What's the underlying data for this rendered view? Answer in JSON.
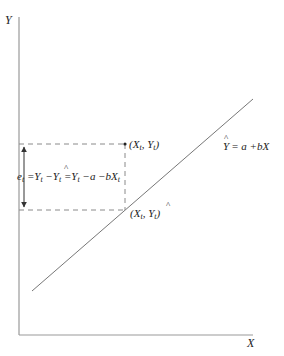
{
  "diagram": {
    "axes": {
      "y_label": "Y",
      "x_label": "X",
      "origin": [
        19,
        335
      ],
      "y_top": 17,
      "x_right": 253
    },
    "regression_line": {
      "equation_label": {
        "y": "Y",
        "rest": "= a +bX"
      },
      "start": [
        32,
        291
      ],
      "end": [
        253,
        99
      ]
    },
    "observed_point": {
      "label_open": "(X",
      "label_sub1": "t",
      "label_mid": ", Y",
      "label_sub2": "t",
      "label_close": ")",
      "position": [
        125,
        144
      ]
    },
    "fitted_point": {
      "label_open": "(X",
      "label_sub1": "t",
      "label_mid": ", Y",
      "label_sub2": "t",
      "label_close": ")",
      "position": [
        125,
        210
      ]
    },
    "residual": {
      "e": "e",
      "e_sub": "t",
      "eq1": " =Y",
      "eq1_sub": "t",
      "minus": " −Y",
      "minus_sub": "t",
      "eq2": " =Y",
      "eq2_sub": "t",
      "tail": " −a −bX",
      "tail_sub": "t"
    },
    "colors": {
      "axis": "#999999",
      "line": "#777777",
      "dash": "#8a8a8a",
      "text": "#222222"
    }
  }
}
